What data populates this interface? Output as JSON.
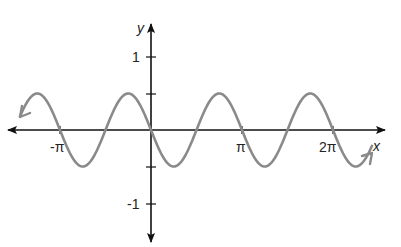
{
  "chart_data": {
    "type": "line",
    "function": "y = -0.5 sin(2x)",
    "title": "",
    "xlabel": "x",
    "ylabel": "y",
    "x_ticks": [
      {
        "value": -3.14159,
        "label": "-π"
      },
      {
        "value": 3.14159,
        "label": "π"
      },
      {
        "value": 6.28318,
        "label": "2π"
      }
    ],
    "y_ticks": [
      {
        "value": 1,
        "label": "1"
      },
      {
        "value": 0.5,
        "label": ""
      },
      {
        "value": -0.5,
        "label": ""
      },
      {
        "value": -1,
        "label": "-1"
      }
    ],
    "amplitude": 0.5,
    "period": 3.14159,
    "xlim": [
      -4.5,
      7.8
    ],
    "ylim": [
      -1.5,
      1.4
    ],
    "curve_x_range": [
      -4.3,
      7.5
    ],
    "curve_arrows": "both ends",
    "grid": false,
    "colors": {
      "axis": "#111111",
      "curve": "#8a8a8a",
      "text": "#222222"
    }
  },
  "labels": {
    "x_axis": "x",
    "y_axis": "y",
    "neg_pi": "-π",
    "pi": "π",
    "two_pi": "2π",
    "one": "1",
    "neg_one": "-1"
  }
}
